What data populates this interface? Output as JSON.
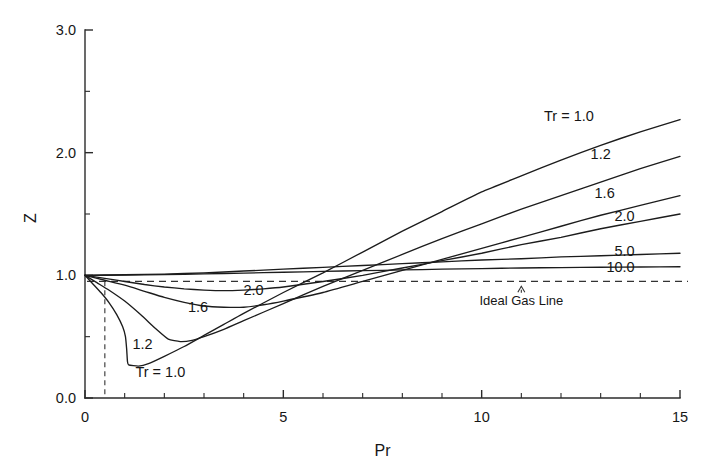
{
  "chart_data": {
    "type": "line",
    "title": "",
    "subtitle": "",
    "xlabel": "Pr",
    "ylabel": "Z",
    "xlim": [
      0,
      15
    ],
    "ylim": [
      0,
      3.0
    ],
    "grid": false,
    "legend_position": "inline-right-end-labels",
    "x_ticks_major": [
      "0",
      "5",
      "10",
      "15"
    ],
    "x_ticks_major_values": [
      0,
      5,
      10,
      15
    ],
    "x_minor_tick_step": 1,
    "y_ticks_major": [
      "0.0",
      "1.0",
      "2.0",
      "3.0"
    ],
    "y_ticks_major_values": [
      0.0,
      1.0,
      2.0,
      3.0
    ],
    "y_minor_tick_step": 0.5,
    "series": [
      {
        "name": "Tr = 1.0",
        "label_left": "Tr   = 1.0",
        "label_right": "Tr  = 1.0",
        "points": [
          [
            0.0,
            1.0
          ],
          [
            0.2,
            0.93
          ],
          [
            0.4,
            0.86
          ],
          [
            0.6,
            0.78
          ],
          [
            0.8,
            0.68
          ],
          [
            0.95,
            0.58
          ],
          [
            1.02,
            0.5
          ],
          [
            1.05,
            0.4
          ],
          [
            1.07,
            0.3
          ],
          [
            1.1,
            0.27
          ],
          [
            1.35,
            0.26
          ],
          [
            1.6,
            0.28
          ],
          [
            2.0,
            0.34
          ],
          [
            2.5,
            0.42
          ],
          [
            3.0,
            0.51
          ],
          [
            3.5,
            0.6
          ],
          [
            4.0,
            0.69
          ],
          [
            5.0,
            0.86
          ],
          [
            6.0,
            1.02
          ],
          [
            7.0,
            1.19
          ],
          [
            8.0,
            1.36
          ],
          [
            9.0,
            1.52
          ],
          [
            10.0,
            1.68
          ],
          [
            11.0,
            1.81
          ],
          [
            12.0,
            1.94
          ],
          [
            13.0,
            2.06
          ],
          [
            14.0,
            2.17
          ],
          [
            15.0,
            2.27
          ]
        ]
      },
      {
        "name": "Tr = 1.2",
        "label_left": "1.2",
        "label_right": "1.2",
        "points": [
          [
            0.0,
            1.0
          ],
          [
            0.3,
            0.94
          ],
          [
            0.6,
            0.88
          ],
          [
            1.0,
            0.79
          ],
          [
            1.4,
            0.68
          ],
          [
            1.8,
            0.56
          ],
          [
            2.1,
            0.48
          ],
          [
            2.4,
            0.46
          ],
          [
            2.7,
            0.47
          ],
          [
            3.0,
            0.5
          ],
          [
            3.5,
            0.56
          ],
          [
            4.0,
            0.63
          ],
          [
            5.0,
            0.77
          ],
          [
            6.0,
            0.91
          ],
          [
            7.0,
            1.04
          ],
          [
            8.0,
            1.17
          ],
          [
            9.0,
            1.3
          ],
          [
            10.0,
            1.42
          ],
          [
            11.0,
            1.54
          ],
          [
            12.0,
            1.65
          ],
          [
            13.0,
            1.76
          ],
          [
            14.0,
            1.87
          ],
          [
            15.0,
            1.97
          ]
        ]
      },
      {
        "name": "Tr = 1.6",
        "label_left": "1.6",
        "label_right": "1.6",
        "points": [
          [
            0.0,
            1.0
          ],
          [
            0.5,
            0.96
          ],
          [
            1.0,
            0.92
          ],
          [
            1.5,
            0.87
          ],
          [
            2.0,
            0.82
          ],
          [
            2.5,
            0.78
          ],
          [
            3.0,
            0.75
          ],
          [
            3.5,
            0.74
          ],
          [
            4.0,
            0.74
          ],
          [
            4.5,
            0.76
          ],
          [
            5.0,
            0.79
          ],
          [
            6.0,
            0.86
          ],
          [
            7.0,
            0.95
          ],
          [
            8.0,
            1.04
          ],
          [
            9.0,
            1.13
          ],
          [
            10.0,
            1.22
          ],
          [
            11.0,
            1.31
          ],
          [
            12.0,
            1.4
          ],
          [
            13.0,
            1.49
          ],
          [
            14.0,
            1.57
          ],
          [
            15.0,
            1.65
          ]
        ]
      },
      {
        "name": "Tr = 2.0",
        "label_left": "2.0",
        "label_right": "2.0",
        "points": [
          [
            0.0,
            1.0
          ],
          [
            0.5,
            0.975
          ],
          [
            1.0,
            0.95
          ],
          [
            1.5,
            0.925
          ],
          [
            2.0,
            0.905
          ],
          [
            2.5,
            0.89
          ],
          [
            3.0,
            0.88
          ],
          [
            3.5,
            0.875
          ],
          [
            4.0,
            0.88
          ],
          [
            4.5,
            0.89
          ],
          [
            5.0,
            0.905
          ],
          [
            6.0,
            0.95
          ],
          [
            7.0,
            1.0
          ],
          [
            8.0,
            1.06
          ],
          [
            9.0,
            1.12
          ],
          [
            10.0,
            1.18
          ],
          [
            11.0,
            1.25
          ],
          [
            12.0,
            1.31
          ],
          [
            13.0,
            1.38
          ],
          [
            14.0,
            1.44
          ],
          [
            15.0,
            1.5
          ]
        ]
      },
      {
        "name": "Tr = 5.0",
        "label_left": "",
        "label_right": "5.0",
        "points": [
          [
            0.0,
            1.0
          ],
          [
            1.0,
            1.005
          ],
          [
            2.0,
            1.01
          ],
          [
            3.0,
            1.02
          ],
          [
            4.0,
            1.035
          ],
          [
            5.0,
            1.05
          ],
          [
            6.0,
            1.065
          ],
          [
            7.0,
            1.08
          ],
          [
            8.0,
            1.095
          ],
          [
            9.0,
            1.11
          ],
          [
            10.0,
            1.125
          ],
          [
            11.0,
            1.135
          ],
          [
            12.0,
            1.15
          ],
          [
            13.0,
            1.16
          ],
          [
            14.0,
            1.17
          ],
          [
            15.0,
            1.18
          ]
        ]
      },
      {
        "name": "Tr = 10.0",
        "label_left": "",
        "label_right": "10.0",
        "points": [
          [
            0.0,
            1.0
          ],
          [
            1.0,
            1.002
          ],
          [
            2.0,
            1.006
          ],
          [
            3.0,
            1.012
          ],
          [
            4.0,
            1.018
          ],
          [
            5.0,
            1.025
          ],
          [
            6.0,
            1.032
          ],
          [
            7.0,
            1.038
          ],
          [
            8.0,
            1.044
          ],
          [
            9.0,
            1.05
          ],
          [
            10.0,
            1.055
          ],
          [
            11.0,
            1.06
          ],
          [
            12.0,
            1.063
          ],
          [
            13.0,
            1.066
          ],
          [
            14.0,
            1.068
          ],
          [
            15.0,
            1.07
          ]
        ]
      }
    ],
    "reference_lines": [
      {
        "name": "ideal-gas-line",
        "orientation": "horizontal",
        "value": 1.0,
        "style": "dashed",
        "label": "Ideal Gas Line"
      },
      {
        "name": "saturation-marker",
        "orientation": "vertical",
        "value": 0.5,
        "style": "dashed",
        "label": ""
      }
    ],
    "annotations": [
      {
        "name": "ideal-gas-line-annotation",
        "text": "Ideal Gas Line",
        "x": 11.0,
        "y": 0.76
      },
      {
        "name": "curve-label-tr-1-0-left",
        "text": "Tr   = 1.0",
        "x": 1.9,
        "y": 0.17
      },
      {
        "name": "curve-label-tr-1-2-left",
        "text": "1.2",
        "x": 1.45,
        "y": 0.4
      },
      {
        "name": "curve-label-tr-1-6-left",
        "text": "1.6",
        "x": 2.85,
        "y": 0.7
      },
      {
        "name": "curve-label-tr-2-0-left",
        "text": "2.0",
        "x": 4.25,
        "y": 0.84
      },
      {
        "name": "curve-label-tr-1-0-right",
        "text": "Tr  = 1.0",
        "x": 12.2,
        "y": 2.26
      },
      {
        "name": "curve-label-tr-1-2-right",
        "text": "1.2",
        "x": 13.0,
        "y": 1.95
      },
      {
        "name": "curve-label-tr-1-6-right",
        "text": "1.6",
        "x": 13.1,
        "y": 1.63
      },
      {
        "name": "curve-label-tr-2-0-right",
        "text": "2.0",
        "x": 13.6,
        "y": 1.44
      },
      {
        "name": "curve-label-tr-5-0-right",
        "text": "5.0",
        "x": 13.6,
        "y": 1.16
      },
      {
        "name": "curve-label-tr-10-0-right",
        "text": "10.0",
        "x": 13.5,
        "y": 1.03
      }
    ],
    "colors": {
      "curve": "#1c1c1c",
      "axis": "#2b2b2b",
      "dashed": "#333333",
      "background": "#ffffff"
    }
  }
}
